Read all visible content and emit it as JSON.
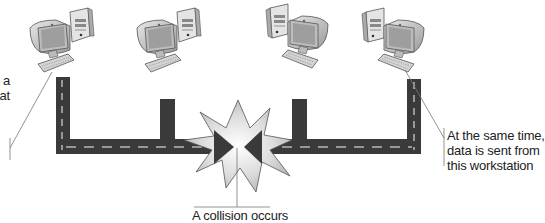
{
  "diagram": {
    "workstations": [
      {
        "id": "ws1",
        "label": "workstation-1",
        "x": 28,
        "orientation": "monitor-left"
      },
      {
        "id": "ws2",
        "label": "workstation-2",
        "x": 135,
        "orientation": "monitor-left"
      },
      {
        "id": "ws3",
        "label": "workstation-3",
        "x": 268,
        "orientation": "monitor-right"
      },
      {
        "id": "ws4",
        "label": "workstation-4",
        "x": 362,
        "orientation": "monitor-right"
      }
    ],
    "callouts": {
      "left": {
        "lines": [
          "a",
          "at"
        ]
      },
      "right": {
        "lines": [
          "At the same time,",
          "data is sent from",
          "this workstation"
        ]
      },
      "bottom": {
        "text": "A collision occurs"
      }
    },
    "colors": {
      "road": "#3a3a3a",
      "road_dash": "#b8b8b8",
      "starburst_fill": "#d9d9d9",
      "starburst_stroke": "#555555",
      "leader_line": "#777777",
      "text": "#222222"
    }
  }
}
